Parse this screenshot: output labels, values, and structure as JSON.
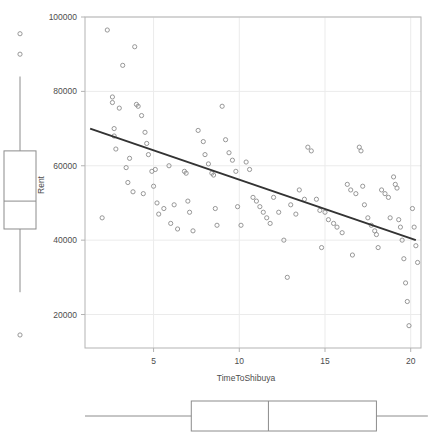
{
  "chart_data": {
    "type": "scatter",
    "title": "",
    "subtitle": "",
    "xlabel": "TimeToShibuya",
    "ylabel": "Rent",
    "xlim": [
      1,
      20.6
    ],
    "ylim": [
      11000,
      100000
    ],
    "grid": true,
    "legend": false,
    "x_ticks": [
      5,
      10,
      15,
      20
    ],
    "x_tick_labels": [
      "5",
      "10",
      "15",
      "20"
    ],
    "y_ticks": [
      20000,
      40000,
      60000,
      80000,
      100000
    ],
    "y_tick_labels": [
      "20000",
      "40000",
      "60000",
      "80000",
      "100000"
    ],
    "marker": "open-circle",
    "marker_color": "#8c8c8c",
    "points": [
      [
        2.0,
        46000
      ],
      [
        2.3,
        96500
      ],
      [
        2.6,
        78500
      ],
      [
        2.6,
        77000
      ],
      [
        2.7,
        70000
      ],
      [
        2.7,
        68000
      ],
      [
        2.8,
        64500
      ],
      [
        3.0,
        75500
      ],
      [
        3.2,
        87000
      ],
      [
        3.4,
        59500
      ],
      [
        3.5,
        55500
      ],
      [
        3.6,
        62000
      ],
      [
        3.9,
        92000
      ],
      [
        4.0,
        76500
      ],
      [
        4.1,
        76000
      ],
      [
        4.3,
        73500
      ],
      [
        4.5,
        69000
      ],
      [
        4.6,
        66000
      ],
      [
        4.7,
        63000
      ],
      [
        4.9,
        58500
      ],
      [
        5.0,
        54500
      ],
      [
        5.1,
        59000
      ],
      [
        5.2,
        50000
      ],
      [
        5.3,
        47000
      ],
      [
        5.9,
        60000
      ],
      [
        6.2,
        49500
      ],
      [
        6.4,
        43000
      ],
      [
        6.8,
        58500
      ],
      [
        6.9,
        58000
      ],
      [
        7.0,
        50500
      ],
      [
        7.1,
        47500
      ],
      [
        7.3,
        42500
      ],
      [
        7.6,
        69500
      ],
      [
        7.9,
        66500
      ],
      [
        8.0,
        63000
      ],
      [
        8.2,
        60500
      ],
      [
        8.4,
        58000
      ],
      [
        8.5,
        57500
      ],
      [
        8.6,
        48500
      ],
      [
        8.7,
        44000
      ],
      [
        9.0,
        76000
      ],
      [
        9.2,
        67000
      ],
      [
        9.4,
        63500
      ],
      [
        9.6,
        61500
      ],
      [
        9.8,
        58500
      ],
      [
        9.9,
        49000
      ],
      [
        10.1,
        44000
      ],
      [
        10.4,
        61000
      ],
      [
        10.6,
        59000
      ],
      [
        10.8,
        51500
      ],
      [
        11.0,
        50500
      ],
      [
        11.2,
        49000
      ],
      [
        11.4,
        47500
      ],
      [
        11.6,
        46000
      ],
      [
        11.8,
        44500
      ],
      [
        12.0,
        51500
      ],
      [
        12.3,
        47500
      ],
      [
        12.6,
        40000
      ],
      [
        13.0,
        49500
      ],
      [
        13.3,
        47000
      ],
      [
        13.5,
        53500
      ],
      [
        13.8,
        51000
      ],
      [
        14.0,
        65000
      ],
      [
        14.2,
        64000
      ],
      [
        14.5,
        51000
      ],
      [
        14.7,
        48000
      ],
      [
        15.0,
        47500
      ],
      [
        15.2,
        45500
      ],
      [
        15.5,
        44500
      ],
      [
        15.7,
        43500
      ],
      [
        16.0,
        42000
      ],
      [
        16.3,
        55000
      ],
      [
        16.5,
        53500
      ],
      [
        16.8,
        52500
      ],
      [
        17.0,
        65000
      ],
      [
        17.1,
        64000
      ],
      [
        17.2,
        54500
      ],
      [
        17.3,
        49500
      ],
      [
        17.5,
        46000
      ],
      [
        17.7,
        44000
      ],
      [
        17.9,
        42500
      ],
      [
        18.0,
        41500
      ],
      [
        18.1,
        38000
      ],
      [
        18.3,
        53500
      ],
      [
        18.5,
        52500
      ],
      [
        18.7,
        51500
      ],
      [
        18.8,
        46000
      ],
      [
        19.0,
        57000
      ],
      [
        19.1,
        55000
      ],
      [
        19.2,
        54000
      ],
      [
        19.3,
        45500
      ],
      [
        19.4,
        43500
      ],
      [
        19.5,
        40000
      ],
      [
        19.6,
        35000
      ],
      [
        19.7,
        28500
      ],
      [
        19.8,
        23500
      ],
      [
        19.9,
        17000
      ],
      [
        20.1,
        48500
      ],
      [
        20.2,
        43500
      ],
      [
        20.3,
        38500
      ],
      [
        20.4,
        34000
      ],
      [
        12.8,
        30000
      ],
      [
        16.6,
        36000
      ],
      [
        14.8,
        38000
      ],
      [
        5.6,
        48500
      ],
      [
        6.0,
        44500
      ],
      [
        4.4,
        52500
      ],
      [
        3.8,
        53000
      ]
    ],
    "regression_line": {
      "x0": 1.3,
      "y0": 70000,
      "x1": 20.3,
      "y1": 40000,
      "color": "#333333",
      "width": 2
    },
    "y_boxplot": {
      "orientation": "vertical",
      "min_whisker": 26000,
      "q1": 43000,
      "median": 50500,
      "q3": 64000,
      "max_whisker": 84000,
      "outliers": [
        95500,
        90000,
        14500
      ],
      "color": "#8c8c8c"
    },
    "x_boxplot": {
      "orientation": "horizontal",
      "min_whisker": 1.0,
      "q1": 7.2,
      "median": 11.7,
      "q3": 18.0,
      "max_whisker": 21.0,
      "outliers": [],
      "color": "#8c8c8c"
    }
  },
  "colors": {
    "background": "#ffffff",
    "frame": "#b3b3b3",
    "grid": "#ebebeb",
    "text": "#4d4d4d",
    "marker": "#8c8c8c",
    "fit_line": "#333333"
  }
}
